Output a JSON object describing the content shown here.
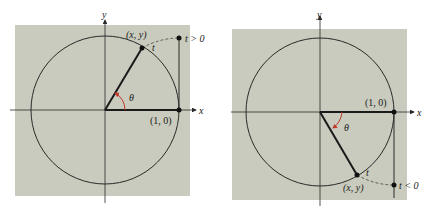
{
  "figure": {
    "colors": {
      "panel_bg": "#c8cbbd",
      "line": "#2a2a2a",
      "angle_arc": "#c0392b",
      "dashed": "#555555"
    },
    "panels": [
      {
        "name": "positive-t",
        "x_axis_label": "x",
        "y_axis_label": "y",
        "point_label": "(x, y)",
        "arc_label": "t",
        "unit_point_label": "(1, 0)",
        "angle_label": "θ",
        "t_condition_label": "t > 0"
      },
      {
        "name": "negative-t",
        "x_axis_label": "x",
        "y_axis_label": "y",
        "point_label": "(x, y)",
        "arc_label": "t",
        "unit_point_label": "(1, 0)",
        "angle_label": "θ",
        "t_condition_label": "t < 0"
      }
    ]
  }
}
